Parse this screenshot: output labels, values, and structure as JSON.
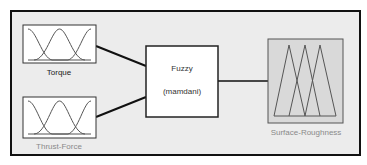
{
  "diagram": {
    "type": "fuzzy-inference-system",
    "inputs": [
      {
        "name": "Torque",
        "mf_type": "gaussian",
        "mf_count": 3,
        "label_style": "selected"
      },
      {
        "name": "Thrust-Force",
        "mf_type": "gaussian",
        "mf_count": 3,
        "label_style": "normal"
      }
    ],
    "system": {
      "name": "Fuzzy",
      "method": "(mamdani)"
    },
    "outputs": [
      {
        "name": "Surface-Roughness",
        "mf_type": "triangular",
        "mf_count": 3
      }
    ],
    "colors": {
      "frame_border": "#111111",
      "frame_bg": "#ececec",
      "input_box_bg": "#ffffff",
      "output_box_bg": "#d9d9d9",
      "curve_stroke": "#555555",
      "connector": "#111111",
      "label_dark": "#1a1a1a",
      "label_gray": "#8a8a8a"
    }
  }
}
